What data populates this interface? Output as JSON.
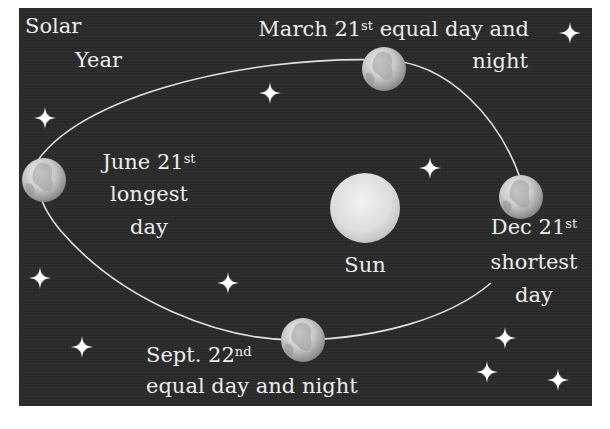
{
  "title": {
    "line1": "Solar",
    "line2": "Year"
  },
  "sun": {
    "label": "Sun",
    "center": [
      365,
      208
    ],
    "radius": 35,
    "color": "#dcdcdc"
  },
  "orbit": {
    "color": "#e0e0e0",
    "shape": "ellipse passing through the four seasonal Earth positions"
  },
  "events": [
    {
      "id": "march",
      "date_main": "March 21",
      "date_suffix": "st",
      "desc_inline": " equal day and",
      "desc_line2": "night",
      "earth_center": [
        384,
        69
      ]
    },
    {
      "id": "june",
      "date_main": "June 21",
      "date_suffix": "st",
      "desc_line1": "longest",
      "desc_line2": "day",
      "earth_center": [
        44,
        180
      ]
    },
    {
      "id": "december",
      "date_main": "Dec 21",
      "date_suffix": "st",
      "desc_line1": "shortest",
      "desc_line2": "day",
      "earth_center": [
        521,
        197
      ]
    },
    {
      "id": "september",
      "date_main": "Sept. 22",
      "date_suffix": "nd",
      "desc_line1": "equal day and night",
      "earth_center": [
        303,
        340
      ]
    }
  ],
  "stars": [
    [
      570,
      33
    ],
    [
      45,
      118
    ],
    [
      270,
      93
    ],
    [
      430,
      168
    ],
    [
      40,
      278
    ],
    [
      228,
      283
    ],
    [
      82,
      347
    ],
    [
      505,
      338
    ],
    [
      487,
      372
    ],
    [
      558,
      380
    ]
  ],
  "colors": {
    "background": "#2b2b2b",
    "text": "#ececec",
    "page": "#ffffff"
  }
}
